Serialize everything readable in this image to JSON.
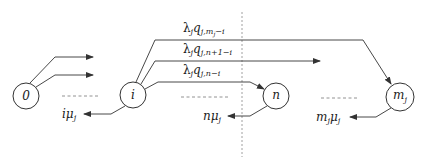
{
  "diagram": {
    "type": "state-transition",
    "nodes": [
      {
        "id": "0",
        "label": "0"
      },
      {
        "id": "i",
        "label": "i"
      },
      {
        "id": "n",
        "label": "n"
      },
      {
        "id": "mj",
        "label": "m",
        "label_sub": "j"
      }
    ],
    "edges": [
      {
        "from": "i",
        "to": "mj",
        "label_main": "λ",
        "label_sub1": "j",
        "label_q": "q",
        "label_sub2": "j,m",
        "label_sub3": "j",
        "label_tail": "−i",
        "full_label": "λ_j q_{j,m_j−i}"
      },
      {
        "from": "i",
        "to": "n+1 (off-diagram)",
        "label_main": "λ",
        "label_sub1": "j",
        "label_q": "q",
        "label_sub2": "j,n+1−i",
        "full_label": "λ_j q_{j,n+1−i}"
      },
      {
        "from": "i",
        "to": "n",
        "label_main": "λ",
        "label_sub1": "j",
        "label_q": "q",
        "label_sub2": "j,n−i",
        "full_label": "λ_j q_{j,n−i}"
      }
    ],
    "departures": [
      {
        "from": "i",
        "label_coef": "i",
        "label_mu": "μ",
        "label_sub": "j",
        "full_label": "iμ_j"
      },
      {
        "from": "n",
        "label_coef": "n",
        "label_mu": "μ",
        "label_sub": "j",
        "full_label": "nμ_j"
      },
      {
        "from": "mj",
        "label_coef": "m",
        "label_coef_sub": "j",
        "label_mu": "μ",
        "label_sub": "j",
        "full_label": "m_jμ_j"
      }
    ],
    "ellipsis": "- - - - - -",
    "colors": {
      "stroke": "#333333",
      "divider": "#888888",
      "text": "#222222"
    }
  }
}
